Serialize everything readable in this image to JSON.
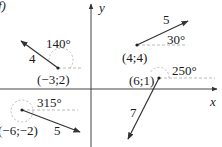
{
  "figure": {
    "panel_label": "f)",
    "axes": {
      "x_label": "x",
      "y_label": "y"
    },
    "vectors": [
      {
        "point_label": "(-3;2)",
        "magnitude_label": "4",
        "angle_label": "140°",
        "tail": [
          -3,
          2
        ],
        "magnitude": 4,
        "angle_deg": 140
      },
      {
        "point_label": "(4;4)",
        "magnitude_label": "5",
        "angle_label": "30°",
        "tail": [
          4,
          4
        ],
        "magnitude": 5,
        "angle_deg": 30
      },
      {
        "point_label": "(6;1)",
        "magnitude_label": "7",
        "angle_label": "250°",
        "tail": [
          6,
          1
        ],
        "magnitude": 7,
        "angle_deg": 250
      },
      {
        "point_label": "(-6;-2)",
        "magnitude_label": "5",
        "angle_label": "315°",
        "tail": [
          -6,
          -2
        ],
        "magnitude": 5,
        "angle_deg": 315
      }
    ],
    "colors": {
      "line": "#333333",
      "dashed": "#999999",
      "text": "#1a1a1a"
    }
  }
}
